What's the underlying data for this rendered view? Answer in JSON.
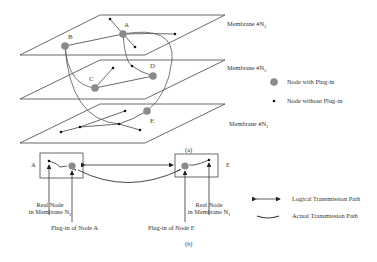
{
  "membranes": [
    {
      "id": "n3",
      "label": "Membrane #N",
      "sub": "3"
    },
    {
      "id": "n2",
      "label": "Membrane #N",
      "sub": "2"
    },
    {
      "id": "n1",
      "label": "Membrane #N",
      "sub": "1"
    }
  ],
  "nodes": {
    "A": "A",
    "B": "B",
    "C": "C",
    "D": "D",
    "E": "E"
  },
  "legend_top": {
    "with_plugin": "Node with Plug-in",
    "without_plugin": "Node without Plug-in"
  },
  "legend_bottom": {
    "logical": "Logical Transmission Path",
    "actual": "Actual Transmission Path"
  },
  "part_a_label": "(a)",
  "part_b_label": "(b)",
  "detail": {
    "box_a_label": "A",
    "box_e_label": "E",
    "real_node_a_line1": "Real Node",
    "real_node_a_line2": "in Membrane N",
    "real_node_a_sub": "3",
    "real_node_e_line1": "Real Node",
    "real_node_e_line2": "in Membrane N",
    "real_node_e_sub": "1",
    "plugin_a": "Plug-in of Node A",
    "plugin_e": "Plug-in of Node E"
  },
  "colors": {
    "line": "#444444",
    "plugin_node": "#8a8a8a",
    "plain_node": "#111111"
  }
}
